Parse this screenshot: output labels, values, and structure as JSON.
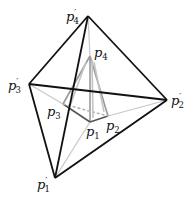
{
  "figure": {
    "outer_tetrahedron": {
      "stroke": "#111111",
      "vertices": [
        {
          "id": "p1p",
          "base": "p",
          "sub": "1",
          "prime": "′",
          "x": 55,
          "y": 178
        },
        {
          "id": "p2p",
          "base": "p",
          "sub": "2",
          "prime": "′",
          "x": 167,
          "y": 100
        },
        {
          "id": "p3p",
          "base": "p",
          "sub": "3",
          "prime": "′",
          "x": 29,
          "y": 84
        },
        {
          "id": "p4p",
          "base": "p",
          "sub": "4",
          "prime": "′",
          "x": 88,
          "y": 16
        }
      ]
    },
    "inner_tetrahedron": {
      "stroke": "#9a9a9a",
      "vertices": [
        {
          "id": "p1",
          "base": "p",
          "sub": "1",
          "x": 90,
          "y": 122
        },
        {
          "id": "p2",
          "base": "p",
          "sub": "2",
          "x": 108,
          "y": 116
        },
        {
          "id": "p3",
          "base": "p",
          "sub": "3",
          "x": 63,
          "y": 104
        },
        {
          "id": "p4",
          "base": "p",
          "sub": "4",
          "x": 90,
          "y": 56
        }
      ]
    },
    "labels": {
      "p4p": {
        "base": "p",
        "sub": "4",
        "prime": "′"
      },
      "p3p": {
        "base": "p",
        "sub": "3",
        "prime": "′"
      },
      "p2p": {
        "base": "p",
        "sub": "2",
        "prime": "′"
      },
      "p1p": {
        "base": "p",
        "sub": "1",
        "prime": "′"
      },
      "p4": {
        "base": "p",
        "sub": "4"
      },
      "p3": {
        "base": "p",
        "sub": "3"
      },
      "p2": {
        "base": "p",
        "sub": "2"
      },
      "p1": {
        "base": "p",
        "sub": "1"
      }
    }
  }
}
